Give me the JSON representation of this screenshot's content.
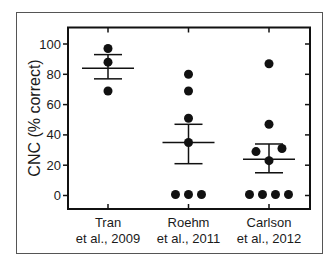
{
  "chart_data": {
    "type": "scatter",
    "title": "",
    "xlabel": "",
    "ylabel": "CNC (% correct)",
    "ylim": [
      -10,
      110
    ],
    "yticks": [
      0,
      20,
      40,
      60,
      80,
      100
    ],
    "grid": false,
    "legend": null,
    "categories": [
      "Tran et al., 2009",
      "Roehm et al., 2011",
      "Carlson et al., 2012"
    ],
    "category_lines": [
      [
        "Tran",
        "et al., 2009"
      ],
      [
        "Roehm",
        "et al., 2011"
      ],
      [
        "Carlson",
        "et al., 2012"
      ]
    ],
    "series": [
      {
        "name": "Tran et al., 2009",
        "points": [
          97,
          88,
          69
        ],
        "mean": 84,
        "error_upper": 93,
        "error_lower": 77
      },
      {
        "name": "Roehm et al., 2011",
        "points": [
          80,
          69,
          51,
          35,
          0,
          0,
          0
        ],
        "mean": 35,
        "error_upper": 47,
        "error_lower": 21
      },
      {
        "name": "Carlson et al., 2012",
        "points": [
          87,
          47,
          31,
          29,
          23,
          0,
          0,
          0,
          0
        ],
        "mean": 24,
        "error_upper": 34,
        "error_lower": 15
      }
    ]
  },
  "style": {
    "ink": "#111111",
    "frame": "#555555",
    "background": "#ffffff"
  }
}
